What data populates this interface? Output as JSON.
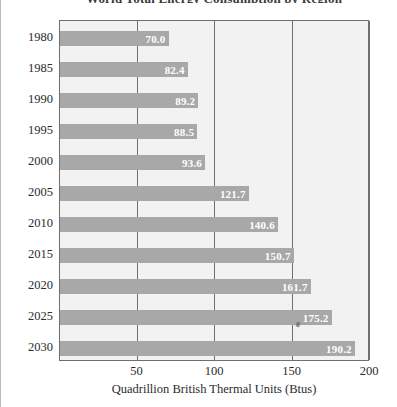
{
  "figure": {
    "title": "World Total Energy Consumption by Region",
    "background_color": "#ffffff",
    "plot_background_color": "#f2f2f2",
    "bar_color": "#a8a8a8",
    "axis_color": "#6f6f6f",
    "value_label_color": "#ffffff"
  },
  "chart_data": {
    "type": "bar",
    "orientation": "horizontal",
    "title": "World Total Energy Consumption by Region",
    "xlabel": "Quadrillion British Thermal Units (Btus)",
    "ylabel": "",
    "xlim": [
      0,
      200
    ],
    "xticks": [
      50,
      100,
      150,
      200
    ],
    "xtick_labels": [
      "50",
      "100",
      "150",
      "200"
    ],
    "grid": true,
    "grid_axis": "x",
    "legend": false,
    "categories": [
      "1980",
      "1985",
      "1990",
      "1995",
      "2000",
      "2005",
      "2010",
      "2015",
      "2020",
      "2025",
      "2030"
    ],
    "values": [
      70.0,
      82.4,
      89.2,
      88.5,
      93.6,
      121.7,
      140.6,
      150.7,
      161.7,
      175.2,
      190.2
    ],
    "value_labels": [
      "70.0",
      "82.4",
      "89.2",
      "88.5",
      "93.6",
      "121.7",
      "140.6",
      "150.7",
      "161.7",
      "175.2",
      "190.2"
    ],
    "value_label_position": "inside-end"
  }
}
